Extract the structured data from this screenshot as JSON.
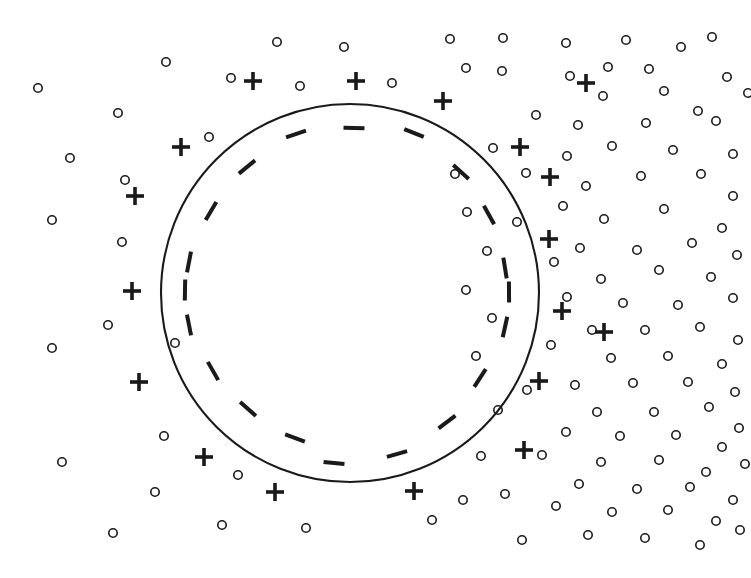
{
  "figure": {
    "title": "",
    "kind": "scientific-diagram",
    "background_color": "#ffffff",
    "ink_color": "#1a1a1a"
  },
  "chart_data": {
    "type": "scatter",
    "title": "",
    "xlabel": "",
    "ylabel": "",
    "xlim": [
      0,
      751
    ],
    "ylim": [
      0,
      578
    ],
    "grid": false,
    "legend": "none",
    "series": [
      {
        "name": "boundary-circle",
        "marker": "circle-outline",
        "stroke_width": 2.1,
        "center": [
          350,
          293
        ],
        "radius": 189
      },
      {
        "name": "negative-charges",
        "marker": "minus",
        "count": 20,
        "placement": "inside boundary, radial ring at r = 163",
        "glyph_length": 21,
        "glyph_thickness": 4,
        "points": [
          [
            354,
            128
          ],
          [
            296,
            134
          ],
          [
            414,
            133
          ],
          [
            247,
            167
          ],
          [
            461,
            172
          ],
          [
            211,
            211
          ],
          [
            489,
            215
          ],
          [
            189,
            262
          ],
          [
            505,
            268
          ],
          [
            185,
            290
          ],
          [
            509,
            292
          ],
          [
            189,
            325
          ],
          [
            505,
            327
          ],
          [
            213,
            371
          ],
          [
            480,
            378
          ],
          [
            248,
            409
          ],
          [
            447,
            422
          ],
          [
            295,
            438
          ],
          [
            397,
            454
          ],
          [
            334,
            463
          ]
        ]
      },
      {
        "name": "positive-counter-ions",
        "marker": "plus",
        "count": 18,
        "placement": "outside boundary, radial ring at r = 216",
        "glyph_size": 18,
        "glyph_thickness": 3.6,
        "points": [
          [
            356,
            81
          ],
          [
            253,
            81
          ],
          [
            443,
            101
          ],
          [
            181,
            147
          ],
          [
            520,
            147
          ],
          [
            135,
            196
          ],
          [
            550,
            177
          ],
          [
            549,
            239
          ],
          [
            132,
            291
          ],
          [
            562,
            311
          ],
          [
            139,
            382
          ],
          [
            539,
            381
          ],
          [
            204,
            457
          ],
          [
            524,
            450
          ],
          [
            275,
            492
          ],
          [
            414,
            491
          ],
          [
            586,
            83
          ],
          [
            604,
            332
          ]
        ]
      },
      {
        "name": "ambient-ions-sparse-left",
        "marker": "small-open-circle",
        "radius": 4.2,
        "count": 24,
        "points": [
          [
            38,
            88
          ],
          [
            118,
            113
          ],
          [
            166,
            62
          ],
          [
            277,
            42
          ],
          [
            231,
            78
          ],
          [
            344,
            47
          ],
          [
            450,
            39
          ],
          [
            52,
            220
          ],
          [
            122,
            242
          ],
          [
            108,
            325
          ],
          [
            52,
            348
          ],
          [
            164,
            436
          ],
          [
            62,
            462
          ],
          [
            155,
            492
          ],
          [
            113,
            533
          ],
          [
            222,
            525
          ],
          [
            306,
            528
          ],
          [
            238,
            475
          ],
          [
            175,
            343
          ],
          [
            300,
            86
          ],
          [
            392,
            83
          ],
          [
            125,
            180
          ],
          [
            70,
            158
          ],
          [
            209,
            137
          ]
        ]
      },
      {
        "name": "ambient-ions-dense-right",
        "marker": "small-open-circle",
        "radius": 4.2,
        "count": 96,
        "points": [
          [
            503,
            38
          ],
          [
            566,
            43
          ],
          [
            626,
            40
          ],
          [
            649,
            69
          ],
          [
            712,
            37
          ],
          [
            681,
            47
          ],
          [
            608,
            67
          ],
          [
            570,
            76
          ],
          [
            502,
            71
          ],
          [
            466,
            68
          ],
          [
            536,
            115
          ],
          [
            603,
            96
          ],
          [
            664,
            91
          ],
          [
            727,
            77
          ],
          [
            698,
            111
          ],
          [
            578,
            125
          ],
          [
            646,
            123
          ],
          [
            716,
            121
          ],
          [
            567,
            156
          ],
          [
            612,
            146
          ],
          [
            673,
            150
          ],
          [
            733,
            154
          ],
          [
            493,
            148
          ],
          [
            526,
            173
          ],
          [
            586,
            186
          ],
          [
            641,
            176
          ],
          [
            701,
            174
          ],
          [
            733,
            196
          ],
          [
            563,
            206
          ],
          [
            604,
            219
          ],
          [
            664,
            209
          ],
          [
            722,
            228
          ],
          [
            517,
            222
          ],
          [
            580,
            248
          ],
          [
            637,
            250
          ],
          [
            692,
            243
          ],
          [
            737,
            255
          ],
          [
            554,
            262
          ],
          [
            601,
            279
          ],
          [
            659,
            270
          ],
          [
            711,
            277
          ],
          [
            567,
            297
          ],
          [
            623,
            303
          ],
          [
            678,
            305
          ],
          [
            733,
            298
          ],
          [
            592,
            330
          ],
          [
            645,
            330
          ],
          [
            700,
            327
          ],
          [
            738,
            340
          ],
          [
            551,
            345
          ],
          [
            611,
            358
          ],
          [
            668,
            356
          ],
          [
            722,
            364
          ],
          [
            575,
            385
          ],
          [
            633,
            383
          ],
          [
            688,
            382
          ],
          [
            735,
            392
          ],
          [
            527,
            390
          ],
          [
            597,
            412
          ],
          [
            654,
            412
          ],
          [
            709,
            407
          ],
          [
            739,
            428
          ],
          [
            566,
            432
          ],
          [
            620,
            436
          ],
          [
            676,
            435
          ],
          [
            722,
            447
          ],
          [
            542,
            455
          ],
          [
            601,
            462
          ],
          [
            659,
            460
          ],
          [
            706,
            472
          ],
          [
            745,
            464
          ],
          [
            579,
            484
          ],
          [
            637,
            489
          ],
          [
            690,
            487
          ],
          [
            733,
            500
          ],
          [
            556,
            506
          ],
          [
            612,
            512
          ],
          [
            668,
            510
          ],
          [
            716,
            521
          ],
          [
            588,
            535
          ],
          [
            645,
            538
          ],
          [
            700,
            545
          ],
          [
            740,
            530
          ],
          [
            505,
            494
          ],
          [
            481,
            456
          ],
          [
            498,
            410
          ],
          [
            476,
            356
          ],
          [
            492,
            318
          ],
          [
            466,
            290
          ],
          [
            487,
            251
          ],
          [
            467,
            212
          ],
          [
            455,
            174
          ],
          [
            463,
            500
          ],
          [
            432,
            520
          ],
          [
            522,
            540
          ],
          [
            748,
            93
          ]
        ]
      }
    ]
  }
}
